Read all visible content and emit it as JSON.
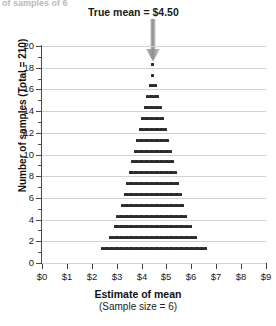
{
  "figure": {
    "cut_top_text": "of samples of 6",
    "annotation": "True mean  =  $4.50",
    "annotation_icon": "down-arrow-icon"
  },
  "axes": {
    "y_title": "Number of samples (Total = 210)",
    "x_title": "Estimate of mean",
    "x_subtitle": "(Sample size = 6)",
    "y_ticks": [
      "0",
      "2",
      "4",
      "6",
      "8",
      "10",
      "12",
      "14",
      "16",
      "18",
      "20"
    ],
    "x_ticks": [
      "$0",
      "$1",
      "$2",
      "$3",
      "$4",
      "$5",
      "$6",
      "$7",
      "$8",
      "$9"
    ]
  },
  "colors": {
    "dot": "#2b2b2b",
    "grid": "#d2d2d2",
    "axis": "#3a3a3a",
    "arrow": "#9a9a9a"
  },
  "chart_data": {
    "type": "scatter",
    "subtype": "dotplot-histogram",
    "title": "True mean  =  $4.50",
    "xlabel": "Estimate of mean (Sample size = 6)",
    "ylabel": "Number of samples (Total = 210)",
    "xlim": [
      0,
      9
    ],
    "ylim": [
      0,
      20
    ],
    "grid": true,
    "true_mean": 4.5,
    "total_samples": 210,
    "sample_size": 6,
    "bin_width": 0.1,
    "annotations": [
      {
        "text": "True mean  =  $4.50",
        "x": 4.5,
        "type": "arrow-down"
      }
    ],
    "bins": [
      {
        "x": 2.45,
        "count": 1
      },
      {
        "x": 2.55,
        "count": 1
      },
      {
        "x": 2.65,
        "count": 1
      },
      {
        "x": 2.75,
        "count": 2
      },
      {
        "x": 2.85,
        "count": 2
      },
      {
        "x": 2.95,
        "count": 3
      },
      {
        "x": 3.05,
        "count": 4
      },
      {
        "x": 3.15,
        "count": 4
      },
      {
        "x": 3.25,
        "count": 5
      },
      {
        "x": 3.35,
        "count": 6
      },
      {
        "x": 3.45,
        "count": 7
      },
      {
        "x": 3.55,
        "count": 8
      },
      {
        "x": 3.65,
        "count": 9
      },
      {
        "x": 3.75,
        "count": 10
      },
      {
        "x": 3.85,
        "count": 11
      },
      {
        "x": 3.95,
        "count": 12
      },
      {
        "x": 4.05,
        "count": 13
      },
      {
        "x": 4.15,
        "count": 14
      },
      {
        "x": 4.25,
        "count": 15
      },
      {
        "x": 4.35,
        "count": 16
      },
      {
        "x": 4.45,
        "count": 18
      },
      {
        "x": 4.55,
        "count": 16
      },
      {
        "x": 4.65,
        "count": 15
      },
      {
        "x": 4.75,
        "count": 14
      },
      {
        "x": 4.85,
        "count": 13
      },
      {
        "x": 4.95,
        "count": 12
      },
      {
        "x": 5.05,
        "count": 11
      },
      {
        "x": 5.15,
        "count": 10
      },
      {
        "x": 5.25,
        "count": 9
      },
      {
        "x": 5.35,
        "count": 8
      },
      {
        "x": 5.45,
        "count": 7
      },
      {
        "x": 5.55,
        "count": 6
      },
      {
        "x": 5.65,
        "count": 5
      },
      {
        "x": 5.75,
        "count": 4
      },
      {
        "x": 5.85,
        "count": 3
      },
      {
        "x": 5.95,
        "count": 3
      },
      {
        "x": 6.05,
        "count": 2
      },
      {
        "x": 6.15,
        "count": 2
      },
      {
        "x": 6.25,
        "count": 1
      },
      {
        "x": 6.35,
        "count": 1
      },
      {
        "x": 6.45,
        "count": 1
      },
      {
        "x": 6.55,
        "count": 1
      }
    ]
  }
}
